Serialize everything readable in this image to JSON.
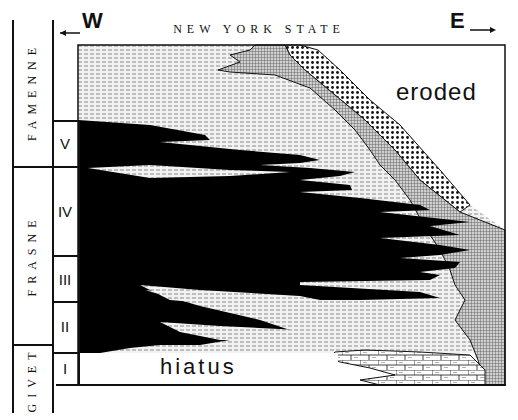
{
  "figure": {
    "title": "NEW YORK STATE",
    "west_label": "W",
    "east_label": "E",
    "eroded_label": "eroded",
    "hiatus_label": "hiatus"
  },
  "stages": [
    {
      "name": "FAMENNE",
      "top": 20,
      "bottom": 167
    },
    {
      "name": "FRASNE",
      "top": 167,
      "bottom": 345
    },
    {
      "name": "GIVET",
      "top": 345,
      "bottom": 410
    }
  ],
  "zones": [
    {
      "name": "V",
      "top": 120,
      "bottom": 167
    },
    {
      "name": "IV",
      "top": 167,
      "bottom": 256
    },
    {
      "name": "III",
      "top": 256,
      "bottom": 302
    },
    {
      "name": "II",
      "top": 302,
      "bottom": 353
    },
    {
      "name": "I",
      "top": 353,
      "bottom": 384
    }
  ],
  "legend_patterns": {
    "black_shale": "#000000",
    "grey_shale_dashed": "#d9d9d9",
    "grey_crosshatch": "#9a9a9a",
    "dotted": "#ffffff",
    "limestone_brick": "#ffffff",
    "eroded": "#ffffff"
  }
}
